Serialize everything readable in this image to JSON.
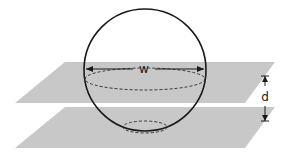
{
  "diagram": {
    "labels": {
      "width": "w",
      "distance": "d"
    },
    "colors": {
      "plane": "#c8c8c8",
      "sphere_stroke": "#1a1a1a",
      "dashed": "#3a3a3a",
      "background": "#ffffff"
    }
  }
}
